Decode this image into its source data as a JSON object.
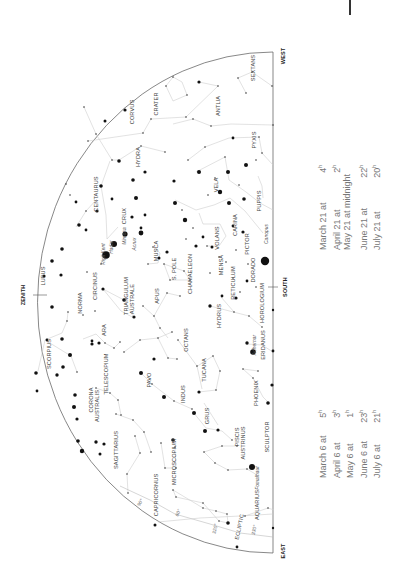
{
  "chart_title": "",
  "directions": {
    "west": "WEST",
    "south": "SOUTH",
    "east": "EAST",
    "zenith": "ZENITH"
  },
  "constellations": [
    {
      "name": "SEXTANS",
      "x": 254,
      "y": 68
    },
    {
      "name": "CRATER",
      "x": 157,
      "y": 104
    },
    {
      "name": "CORVUS",
      "x": 133,
      "y": 112
    },
    {
      "name": "ANTLIA",
      "x": 219,
      "y": 106
    },
    {
      "name": "HYDRA",
      "x": 139,
      "y": 157
    },
    {
      "name": "PYXIS",
      "x": 255,
      "y": 140
    },
    {
      "name": "VELA",
      "x": 217,
      "y": 185
    },
    {
      "name": "CENTAURUS",
      "x": 97,
      "y": 194
    },
    {
      "name": "CRUX",
      "x": 125,
      "y": 216
    },
    {
      "name": "PUPPIS",
      "x": 260,
      "y": 201
    },
    {
      "name": "CARINA",
      "x": 236,
      "y": 225
    },
    {
      "name": "VOLANS",
      "x": 218,
      "y": 238
    },
    {
      "name": "MUSCA",
      "x": 157,
      "y": 251
    },
    {
      "name": "PICTOR",
      "x": 248,
      "y": 244
    },
    {
      "name": "LUPUS",
      "x": 39,
      "y": 287,
      "hide": true
    },
    {
      "name": "LUPUS",
      "x": 44,
      "y": 276
    },
    {
      "name": "DORADO",
      "x": 254,
      "y": 270
    },
    {
      "name": "MENSA",
      "x": 222,
      "y": 265
    },
    {
      "name": "CIRCINUS",
      "x": 96,
      "y": 286
    },
    {
      "name": "NORMA",
      "x": 81,
      "y": 303
    },
    {
      "name": "CHAMAELEON",
      "x": 191,
      "y": 274
    },
    {
      "name": "S. POLE",
      "x": 175,
      "y": 269
    },
    {
      "name": "APUS",
      "x": 158,
      "y": 296
    },
    {
      "name": "TRIANGULUM",
      "x": 127,
      "y": 296
    },
    {
      "name": "AUSTRALE",
      "x": 133,
      "y": 299
    },
    {
      "name": "RETICULUM",
      "x": 234,
      "y": 283
    },
    {
      "name": "HOROLOGIUM",
      "x": 263,
      "y": 303
    },
    {
      "name": "ARA",
      "x": 105,
      "y": 330
    },
    {
      "name": "HYDRUS",
      "x": 220,
      "y": 316
    },
    {
      "name": "OCTANS",
      "x": 187,
      "y": 340
    },
    {
      "name": "ERIDANUS",
      "x": 264,
      "y": 345
    },
    {
      "name": "SCORPIUS",
      "x": 50,
      "y": 354
    },
    {
      "name": "TELESCOPIUM",
      "x": 107,
      "y": 374
    },
    {
      "name": "PAVO",
      "x": 150,
      "y": 380
    },
    {
      "name": "TUCANA",
      "x": 205,
      "y": 370
    },
    {
      "name": "CORONA",
      "x": 92,
      "y": 400
    },
    {
      "name": "AUSTRALIS",
      "x": 98,
      "y": 406
    },
    {
      "name": "PHOENIX",
      "x": 257,
      "y": 393
    },
    {
      "name": "INDUS",
      "x": 184,
      "y": 394
    },
    {
      "name": "GRUS",
      "x": 208,
      "y": 416
    },
    {
      "name": "PISCIS",
      "x": 238,
      "y": 437
    },
    {
      "name": "AUSTRINUS",
      "x": 244,
      "y": 443
    },
    {
      "name": "SCULPTOR",
      "x": 268,
      "y": 437
    },
    {
      "name": "SAGITTARIUS",
      "x": 117,
      "y": 450
    },
    {
      "name": "MICROSCOPIUM",
      "x": 175,
      "y": 462
    },
    {
      "name": "CAPRICORNUS",
      "x": 157,
      "y": 495
    },
    {
      "name": "AQUARIUS",
      "x": 258,
      "y": 505
    }
  ],
  "named_stars": [
    {
      "name": "Rigil Kent",
      "x": 104,
      "y": 254
    },
    {
      "name": "Hadar",
      "x": 112,
      "y": 247
    },
    {
      "name": "Mimosa",
      "x": 125,
      "y": 236
    },
    {
      "name": "Acrux",
      "x": 135,
      "y": 244
    },
    {
      "name": "Canopus",
      "x": 267,
      "y": 234
    },
    {
      "name": "Achernar",
      "x": 255,
      "y": 345
    },
    {
      "name": "Fomalhaut",
      "x": 258,
      "y": 478
    }
  ],
  "ecliptic": {
    "label": "ECLIPTIC",
    "degree_marks": [
      "90°",
      "60°",
      "310°",
      "320°",
      "330°"
    ]
  },
  "times_left": [
    {
      "date": "March 6 at",
      "time": "5",
      "sup": "h"
    },
    {
      "date": "April 6 at",
      "time": "3",
      "sup": "h"
    },
    {
      "date": "May 6 at",
      "time": "1",
      "sup": "h"
    },
    {
      "date": "June 6 at",
      "time": "23",
      "sup": "h"
    },
    {
      "date": "July 6 at",
      "time": "21",
      "sup": "h"
    }
  ],
  "times_right": [
    {
      "date": "March 21 at",
      "time": "4",
      "sup": "h"
    },
    {
      "date": "April 21 at",
      "time": "2",
      "sup": "h"
    },
    {
      "date": "May 21 at midnight",
      "time": "",
      "sup": ""
    },
    {
      "date": "June 21 at",
      "time": "22",
      "sup": "h"
    },
    {
      "date": "July 21 at",
      "time": "20",
      "sup": "h"
    }
  ]
}
